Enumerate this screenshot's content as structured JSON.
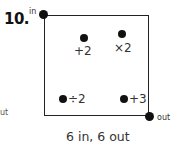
{
  "problem": {
    "number": "10.",
    "entry_label": "in",
    "exit_label": "out",
    "left_fragment": "ut",
    "stations": [
      {
        "id": "plus2",
        "label": "+2"
      },
      {
        "id": "times2",
        "label": "×2"
      },
      {
        "id": "divide2",
        "label": "÷2"
      },
      {
        "id": "plus3",
        "label": "+3"
      }
    ],
    "caption": "6 in, 6 out"
  }
}
